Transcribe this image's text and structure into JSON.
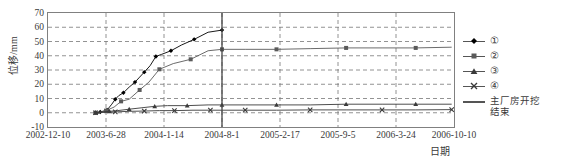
{
  "chart_data": {
    "type": "line",
    "title": "",
    "xlabel": "日期",
    "ylabel": "位移/mm",
    "ylim": [
      -10,
      70
    ],
    "yticks": [
      "70",
      "60",
      "50",
      "40",
      "30",
      "20",
      "10",
      "0",
      "-10"
    ],
    "ytick_values": [
      70,
      60,
      50,
      40,
      30,
      20,
      10,
      0,
      -10
    ],
    "xticks": [
      "2002-12-10",
      "2003-6-28",
      "2004-1-14",
      "2004-8-1",
      "2005-2-17",
      "2005-9-5",
      "2006-3-24",
      "2006-10-10"
    ],
    "xtick_index": [
      0,
      1,
      2,
      3,
      4,
      5,
      6,
      7
    ],
    "grid": "dashed-both",
    "legend_position": "right",
    "marker_line": {
      "label": "主厂房开挖结束",
      "x_date": "2004-8-1",
      "x_index": 3.0
    },
    "series": [
      {
        "name": "①",
        "marker": "diamond",
        "color": "#000000",
        "points": [
          {
            "x": 0.82,
            "y": 0.0
          },
          {
            "x": 0.86,
            "y": -0.5
          },
          {
            "x": 0.9,
            "y": 0.5
          },
          {
            "x": 0.96,
            "y": 1.2
          },
          {
            "x": 1.02,
            "y": 2.0
          },
          {
            "x": 1.1,
            "y": 6.0
          },
          {
            "x": 1.16,
            "y": 9.5
          },
          {
            "x": 1.22,
            "y": 12.0
          },
          {
            "x": 1.3,
            "y": 14.0
          },
          {
            "x": 1.4,
            "y": 18.0
          },
          {
            "x": 1.5,
            "y": 21.5
          },
          {
            "x": 1.58,
            "y": 25.0
          },
          {
            "x": 1.66,
            "y": 28.5
          },
          {
            "x": 1.76,
            "y": 33.0
          },
          {
            "x": 1.86,
            "y": 39.5
          },
          {
            "x": 1.96,
            "y": 41.0
          },
          {
            "x": 2.12,
            "y": 43.5
          },
          {
            "x": 2.3,
            "y": 47.5
          },
          {
            "x": 2.52,
            "y": 51.5
          },
          {
            "x": 2.76,
            "y": 56.5
          },
          {
            "x": 3.0,
            "y": 58.0
          }
        ]
      },
      {
        "name": "②",
        "marker": "square",
        "color": "#5a5a5a",
        "points": [
          {
            "x": 0.82,
            "y": 0.0
          },
          {
            "x": 0.9,
            "y": 0.5
          },
          {
            "x": 1.0,
            "y": 1.5
          },
          {
            "x": 1.14,
            "y": 4.0
          },
          {
            "x": 1.26,
            "y": 8.0
          },
          {
            "x": 1.4,
            "y": 9.5
          },
          {
            "x": 1.58,
            "y": 16.0
          },
          {
            "x": 1.74,
            "y": 21.5
          },
          {
            "x": 1.92,
            "y": 30.5
          },
          {
            "x": 2.16,
            "y": 34.5
          },
          {
            "x": 2.46,
            "y": 37.5
          },
          {
            "x": 2.76,
            "y": 43.5
          },
          {
            "x": 3.0,
            "y": 44.5
          },
          {
            "x": 3.4,
            "y": 44.5
          },
          {
            "x": 3.94,
            "y": 44.5
          },
          {
            "x": 4.52,
            "y": 45.0
          },
          {
            "x": 5.14,
            "y": 45.5
          },
          {
            "x": 5.76,
            "y": 45.5
          },
          {
            "x": 6.34,
            "y": 45.5
          },
          {
            "x": 6.96,
            "y": 46.0
          }
        ]
      },
      {
        "name": "③",
        "marker": "triangle",
        "color": "#3a3a3a",
        "points": [
          {
            "x": 0.82,
            "y": 0.0
          },
          {
            "x": 0.94,
            "y": 0.5
          },
          {
            "x": 1.06,
            "y": 1.0
          },
          {
            "x": 1.2,
            "y": 1.5
          },
          {
            "x": 1.4,
            "y": 2.5
          },
          {
            "x": 1.62,
            "y": 3.5
          },
          {
            "x": 1.84,
            "y": 4.5
          },
          {
            "x": 2.06,
            "y": 5.0
          },
          {
            "x": 2.4,
            "y": 5.0
          },
          {
            "x": 2.76,
            "y": 5.5
          },
          {
            "x": 3.0,
            "y": 5.5
          },
          {
            "x": 3.4,
            "y": 5.5
          },
          {
            "x": 3.94,
            "y": 5.5
          },
          {
            "x": 4.52,
            "y": 5.5
          },
          {
            "x": 5.14,
            "y": 6.0
          },
          {
            "x": 5.76,
            "y": 6.0
          },
          {
            "x": 6.34,
            "y": 6.0
          },
          {
            "x": 6.96,
            "y": 6.0
          }
        ]
      },
      {
        "name": "④",
        "marker": "cross",
        "color": "#3a3a3a",
        "points": [
          {
            "x": 0.82,
            "y": 0.0
          },
          {
            "x": 0.98,
            "y": 0.3
          },
          {
            "x": 1.16,
            "y": 0.6
          },
          {
            "x": 1.4,
            "y": 1.0
          },
          {
            "x": 1.66,
            "y": 1.2
          },
          {
            "x": 1.92,
            "y": 1.5
          },
          {
            "x": 2.18,
            "y": 1.5
          },
          {
            "x": 2.5,
            "y": 1.8
          },
          {
            "x": 2.8,
            "y": 1.8
          },
          {
            "x": 3.0,
            "y": 1.8
          },
          {
            "x": 3.4,
            "y": 1.8
          },
          {
            "x": 3.94,
            "y": 1.8
          },
          {
            "x": 4.52,
            "y": 2.0
          },
          {
            "x": 5.14,
            "y": 2.0
          },
          {
            "x": 5.76,
            "y": 2.0
          },
          {
            "x": 6.34,
            "y": 2.0
          },
          {
            "x": 6.96,
            "y": 2.2
          }
        ]
      }
    ]
  },
  "legend": {
    "items": [
      {
        "label": "①",
        "marker": "diamond"
      },
      {
        "label": "②",
        "marker": "square"
      },
      {
        "label": "③",
        "marker": "triangle"
      },
      {
        "label": "④",
        "marker": "cross"
      },
      {
        "label": "主厂房开挖结束",
        "marker": "plain-line"
      }
    ]
  },
  "axes": {
    "y_title": "位移/mm",
    "x_title": "日期"
  }
}
